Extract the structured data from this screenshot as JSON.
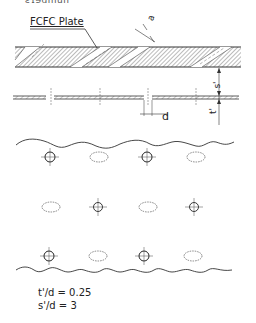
{
  "figure": {
    "top_text_partial": "ƨɿɘdmun",
    "plate_label": "FCFC Plate",
    "dimensions": {
      "slot_width": "a",
      "hole_diameter": "d",
      "gap": "s'",
      "thickness": "t'"
    },
    "ratios": [
      "t'/d = 0.25",
      "s'/d = 3"
    ],
    "hole_grid": {
      "rows": [
        [
          "hole",
          "ellipse",
          "hole",
          "ellipse"
        ],
        [
          "ellipse",
          "hole",
          "ellipse",
          "hole"
        ],
        [
          "hole",
          "ellipse",
          "hole",
          "ellipse"
        ]
      ]
    },
    "colors": {
      "line": "#333333",
      "hatch": "#555555",
      "background": "#ffffff"
    }
  }
}
